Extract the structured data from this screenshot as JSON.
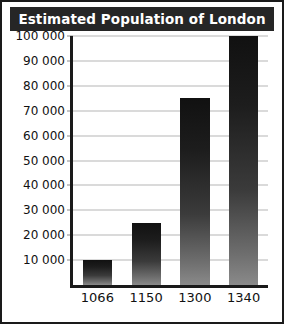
{
  "chart_data": {
    "type": "bar",
    "title": "Estimated Population of London",
    "xlabel": "",
    "ylabel": "",
    "categories": [
      "1066",
      "1150",
      "1300",
      "1340"
    ],
    "values": [
      10000,
      25000,
      75000,
      100000
    ],
    "ylim": [
      0,
      100000
    ],
    "ytick_values": [
      10000,
      20000,
      30000,
      40000,
      50000,
      60000,
      70000,
      80000,
      90000,
      100000
    ],
    "ytick_labels": [
      "100 000",
      "90 000",
      "80 000",
      "70 000",
      "60 000",
      "50 000",
      "40 000",
      "30 000",
      "20 000",
      "10 000"
    ],
    "grid": true,
    "legend": "none",
    "bar_style": "vertical-gradient-dark-to-gray",
    "colors": {
      "title_bar_background": "#262626",
      "title_text": "#ffffff",
      "frame_border": "#1a1a1a",
      "axis_line": "#1a1a1a",
      "gridline": "#b5b5b5",
      "plot_background": "#ffffff",
      "bar_top": "#111111",
      "bar_bottom": "#8a8a8a",
      "tick_label_text": "#111111"
    }
  }
}
